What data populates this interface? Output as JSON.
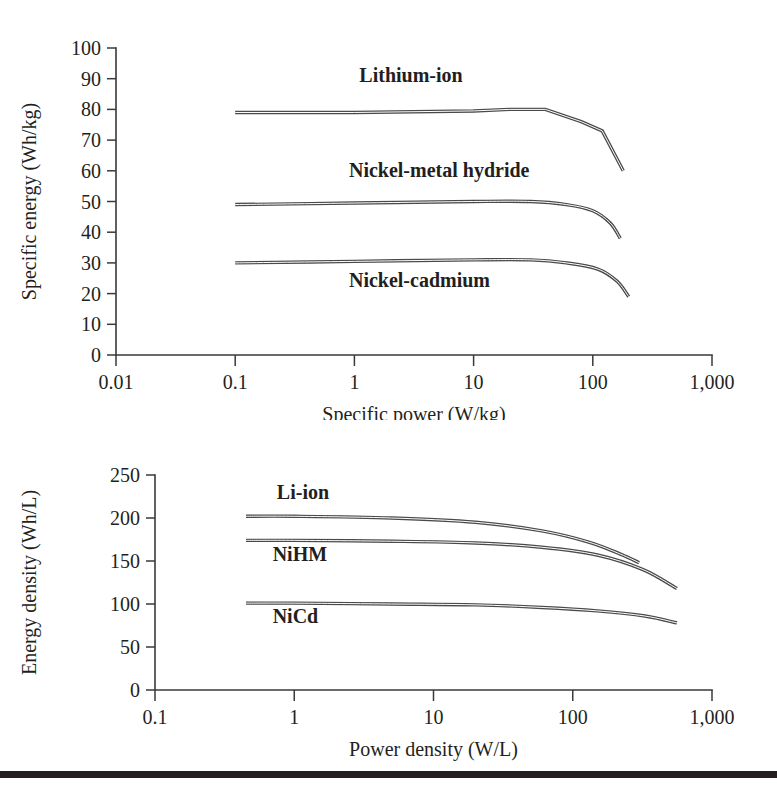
{
  "figure": {
    "background_color": "#ffffff",
    "ink_color": "#231f20",
    "curve_color": "#4a4a4a",
    "rule": {
      "name": "bottom-rule",
      "top": 771,
      "height": 7,
      "color": "#231f20"
    }
  },
  "chart_data": [
    {
      "id": "specific-energy-vs-specific-power",
      "type": "line",
      "title": "",
      "xlabel": "Specific power (W/kg)",
      "ylabel": "Specific energy (Wh/kg)",
      "xscale": "log",
      "xlim": [
        0.01,
        1000
      ],
      "ylim": [
        0,
        100
      ],
      "grid": false,
      "legend": "inline-annotations",
      "xticks": [
        "0.01",
        "0.1",
        "1",
        "10",
        "100",
        "1,000"
      ],
      "xtick_values": [
        0.01,
        0.1,
        1,
        10,
        100,
        1000
      ],
      "yticks": [
        "0",
        "10",
        "20",
        "30",
        "40",
        "50",
        "60",
        "70",
        "80",
        "90",
        "100"
      ],
      "ytick_values": [
        0,
        10,
        20,
        30,
        40,
        50,
        60,
        70,
        80,
        90,
        100
      ],
      "series": [
        {
          "name": "Lithium-ion",
          "label_x": 1.1,
          "label_y": 89,
          "x": [
            0.1,
            1,
            10,
            20,
            40,
            80,
            120,
            180
          ],
          "values": [
            79,
            79,
            79.5,
            80,
            80,
            76,
            73,
            60
          ]
        },
        {
          "name": "Nickel-metal hydride",
          "label_x": 0.9,
          "label_y": 58,
          "x": [
            0.1,
            1,
            10,
            30,
            60,
            100,
            140,
            170
          ],
          "values": [
            49,
            49.5,
            50,
            50,
            49,
            47,
            43,
            38
          ]
        },
        {
          "name": "Nickel-cadmium",
          "label_x": 0.9,
          "label_y": 22,
          "x": [
            0.1,
            1,
            10,
            30,
            60,
            110,
            160,
            200
          ],
          "values": [
            30,
            30.5,
            31,
            31,
            30,
            28,
            24,
            19
          ]
        }
      ]
    },
    {
      "id": "energy-density-vs-power-density",
      "type": "line",
      "title": "",
      "xlabel": "Power density (W/L)",
      "ylabel": "Energy density (Wh/L)",
      "xscale": "log",
      "xlim": [
        0.1,
        1000
      ],
      "ylim": [
        0,
        250
      ],
      "grid": false,
      "legend": "inline-annotations",
      "xticks": [
        "0.1",
        "1",
        "10",
        "100",
        "1,000"
      ],
      "xtick_values": [
        0.1,
        1,
        10,
        100,
        1000
      ],
      "yticks": [
        "0",
        "50",
        "100",
        "150",
        "200",
        "250"
      ],
      "ytick_values": [
        0,
        50,
        100,
        150,
        200,
        250
      ],
      "series": [
        {
          "name": "Li-ion",
          "label_x": 0.75,
          "label_y": 222,
          "x": [
            0.45,
            1,
            5,
            20,
            60,
            130,
            220,
            300
          ],
          "values": [
            202,
            202,
            200,
            195,
            185,
            172,
            158,
            148
          ]
        },
        {
          "name": "NiHM",
          "label_x": 0.7,
          "label_y": 150,
          "x": [
            0.45,
            1,
            5,
            20,
            60,
            150,
            320,
            560
          ],
          "values": [
            174,
            174,
            173,
            171,
            166,
            157,
            140,
            118
          ]
        },
        {
          "name": "NiCd",
          "label_x": 0.7,
          "label_y": 78,
          "x": [
            0.45,
            1,
            5,
            20,
            60,
            150,
            330,
            560
          ],
          "values": [
            101,
            101,
            100,
            99,
            96,
            92,
            86,
            78
          ]
        }
      ]
    }
  ]
}
